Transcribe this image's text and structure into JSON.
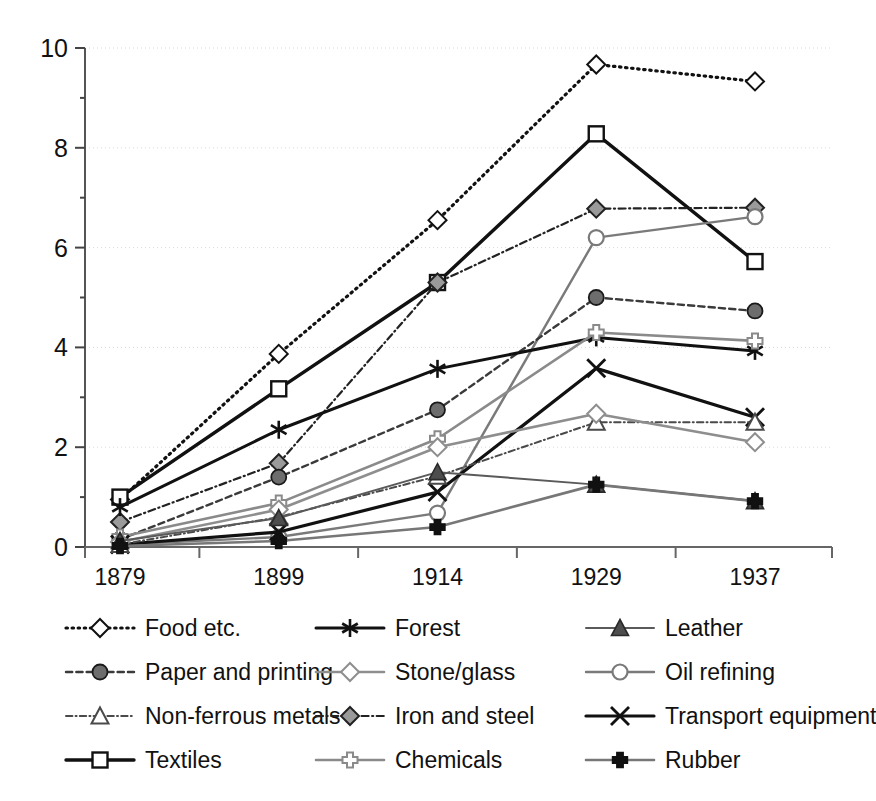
{
  "chart_data": {
    "type": "line",
    "title": "",
    "subtitle": "",
    "xlabel": "",
    "ylabel": "",
    "categories": [
      "1879",
      "1899",
      "1914",
      "1929",
      "1937"
    ],
    "x_tick_labels": [
      "1879",
      "1899",
      "1914",
      "1929",
      "1937"
    ],
    "y_tick_labels": [
      "0",
      "2",
      "4",
      "6",
      "8",
      "10"
    ],
    "y_ticks": [
      0,
      2,
      4,
      6,
      8,
      10
    ],
    "y_minor_ticks": [
      1,
      3,
      5,
      7,
      9
    ],
    "ylim": [
      0,
      10
    ],
    "grid": "horizontal-dotted",
    "legend_position": "below-plot",
    "legend_columns": 3,
    "series": [
      {
        "name": "Food etc.",
        "values": [
          0.95,
          3.87,
          6.55,
          9.67,
          9.33
        ],
        "marker": "diamond-open",
        "line_style": "dotted",
        "color": "#111111",
        "marker_fill": "#ffffff",
        "line_width": 3.2
      },
      {
        "name": "Textiles",
        "values": [
          1.0,
          3.17,
          5.3,
          8.28,
          5.72
        ],
        "marker": "square-open",
        "line_style": "solid",
        "color": "#111111",
        "marker_fill": "#ffffff",
        "line_width": 3.4
      },
      {
        "name": "Iron and steel",
        "values": [
          0.5,
          1.68,
          5.3,
          6.78,
          6.8
        ],
        "marker": "diamond-filled",
        "line_style": "dashdot",
        "color": "#222222",
        "marker_fill": "#9a9a9a",
        "line_width": 2.2
      },
      {
        "name": "Oil refining",
        "values": [
          0.05,
          0.2,
          0.68,
          6.2,
          6.62
        ],
        "marker": "circle-open",
        "line_style": "solid",
        "color": "#7a7a7a",
        "marker_fill": "#ffffff",
        "line_width": 2.4
      },
      {
        "name": "Paper and printing",
        "values": [
          0.15,
          1.4,
          2.75,
          5.0,
          4.73
        ],
        "marker": "circle-filled",
        "line_style": "dashed",
        "color": "#3a3a3a",
        "marker_fill": "#6d6d6d",
        "line_width": 2.4
      },
      {
        "name": "Forest",
        "values": [
          0.8,
          2.35,
          3.57,
          4.2,
          3.93
        ],
        "marker": "asterisk",
        "line_style": "solid",
        "color": "#111111",
        "marker_fill": "#111111",
        "line_width": 3.0
      },
      {
        "name": "Chemicals",
        "values": [
          0.2,
          0.88,
          2.17,
          4.3,
          4.13
        ],
        "marker": "plus-open",
        "line_style": "solid",
        "color": "#8a8a8a",
        "marker_fill": "#ffffff",
        "line_width": 2.6
      },
      {
        "name": "Transport equipment",
        "values": [
          0.05,
          0.3,
          1.1,
          3.58,
          2.6
        ],
        "marker": "cross-x",
        "line_style": "solid",
        "color": "#111111",
        "marker_fill": "#111111",
        "line_width": 3.2
      },
      {
        "name": "Non-ferrous metals",
        "values": [
          0.05,
          0.6,
          1.42,
          2.5,
          2.5
        ],
        "marker": "triangle-open",
        "line_style": "dashdot",
        "color": "#4a4a4a",
        "marker_fill": "#ffffff",
        "line_width": 2.0
      },
      {
        "name": "Stone/glass",
        "values": [
          0.1,
          0.75,
          2.0,
          2.67,
          2.1
        ],
        "marker": "diamond-open",
        "line_style": "solid",
        "color": "#8e8e8e",
        "marker_fill": "#ffffff",
        "line_width": 2.6
      },
      {
        "name": "Leather",
        "values": [
          0.12,
          0.58,
          1.5,
          1.25,
          0.92
        ],
        "marker": "triangle-filled",
        "line_style": "solid",
        "color": "#5a5a5a",
        "marker_fill": "#4d4d4d",
        "line_width": 2.0
      },
      {
        "name": "Rubber",
        "values": [
          0.02,
          0.12,
          0.4,
          1.25,
          0.92
        ],
        "marker": "plus-filled",
        "line_style": "solid",
        "color": "#777777",
        "marker_fill": "#111111",
        "line_width": 2.6
      }
    ]
  },
  "legend": {
    "entries": [
      {
        "label": "Food etc."
      },
      {
        "label": "Paper and printing"
      },
      {
        "label": "Non-ferrous metals"
      },
      {
        "label": "Textiles"
      },
      {
        "label": "Forest"
      },
      {
        "label": "Stone/glass"
      },
      {
        "label": "Iron and steel"
      },
      {
        "label": "Chemicals"
      },
      {
        "label": "Leather"
      },
      {
        "label": "Oil refining"
      },
      {
        "label": "Transport equipment"
      },
      {
        "label": "Rubber"
      }
    ],
    "order_index": [
      0,
      4,
      8,
      1,
      5,
      9,
      2,
      6,
      10,
      3,
      7,
      11
    ]
  },
  "axes": {
    "y_axis_color": "#555555",
    "x_axis_color": "#666666",
    "gridline_color": "#d9d9d9"
  }
}
